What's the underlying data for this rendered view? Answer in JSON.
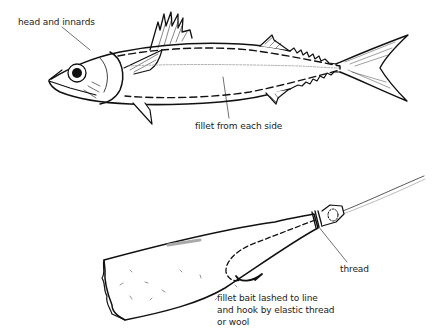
{
  "figure": {
    "top_panel": {
      "subject": "fish (mackerel-like) with fillet cut lines",
      "labels": {
        "head": "head and innards",
        "fillet": "fillet from each side"
      }
    },
    "bottom_panel": {
      "subject": "fillet bait on hook and line",
      "labels": {
        "thread": "thread",
        "bait_line1": "fillet bait lashed to line",
        "bait_line2": "and hook by elastic thread",
        "bait_line3": "or wool"
      }
    }
  }
}
